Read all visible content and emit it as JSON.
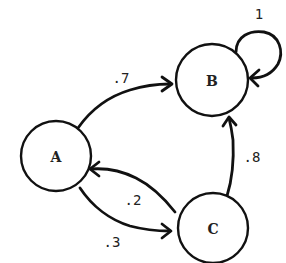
{
  "diagram": {
    "type": "markov-chain-state-diagram",
    "colors": {
      "stroke": "#111111",
      "text": "#222222",
      "background": "#ffffff"
    },
    "nodes": [
      {
        "id": "A",
        "label": "A",
        "cx": 56,
        "cy": 156,
        "r": 35
      },
      {
        "id": "B",
        "label": "B",
        "cx": 212,
        "cy": 80,
        "r": 36
      },
      {
        "id": "C",
        "label": "C",
        "cx": 213,
        "cy": 228,
        "r": 35
      }
    ],
    "edges": [
      {
        "from": "A",
        "to": "B",
        "label": ".7",
        "label_x": 121,
        "label_y": 78
      },
      {
        "from": "B",
        "to": "B",
        "label": "1",
        "label_x": 259,
        "label_y": 14
      },
      {
        "from": "C",
        "to": "B",
        "label": ".8",
        "label_x": 252,
        "label_y": 157
      },
      {
        "from": "C",
        "to": "A",
        "label": ".2",
        "label_x": 133,
        "label_y": 200
      },
      {
        "from": "A",
        "to": "C",
        "label": ".3",
        "label_x": 112,
        "label_y": 242
      }
    ]
  }
}
